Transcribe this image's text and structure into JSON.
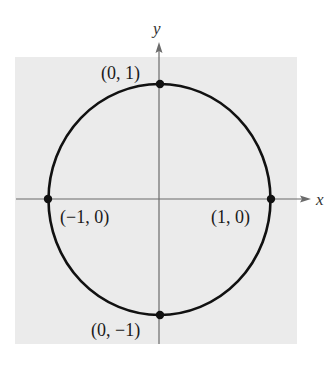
{
  "figure": {
    "background_color": "#ebebeb",
    "circle_color": "#111111",
    "axis_color": "#6b6b6b",
    "axes": {
      "x_label": "x",
      "y_label": "y"
    },
    "points": [
      {
        "id": "top",
        "label": "(0, 1)"
      },
      {
        "id": "left",
        "label": "(−1, 0)"
      },
      {
        "id": "right",
        "label": "(1, 0)"
      },
      {
        "id": "bottom",
        "label": "(0, −1)"
      }
    ]
  }
}
